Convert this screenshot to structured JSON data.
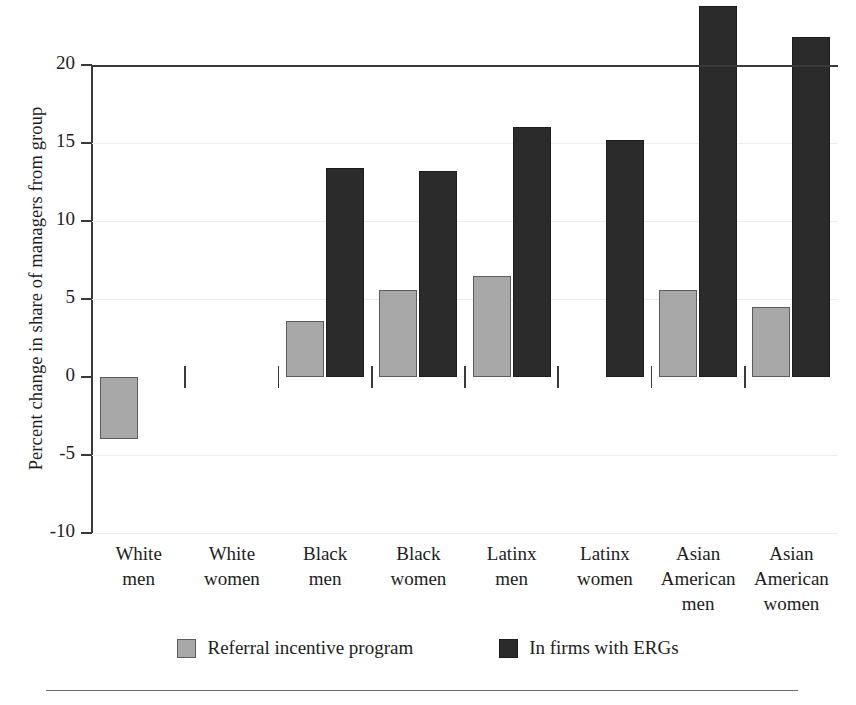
{
  "chart_data": {
    "type": "bar",
    "title": "",
    "subtitle": "",
    "xlabel": "",
    "ylabel": "Percent change in share of managers from group",
    "ylim": [
      -10,
      20
    ],
    "yticks": [
      -10,
      -5,
      0,
      5,
      10,
      15,
      20
    ],
    "ytick_labels": [
      "-10",
      "-5",
      "0",
      "5",
      "10",
      "15",
      "20"
    ],
    "grid": true,
    "grid_axis": "y",
    "legend_position": "bottom-center",
    "categories": [
      "White men",
      "White women",
      "Black men",
      "Black women",
      "Latinx men",
      "Latinx women",
      "Asian American men",
      "Asian American women"
    ],
    "category_lines": [
      [
        "White",
        "men"
      ],
      [
        "White",
        "women"
      ],
      [
        "Black",
        "men"
      ],
      [
        "Black",
        "women"
      ],
      [
        "Latinx",
        "men"
      ],
      [
        "Latinx",
        "women"
      ],
      [
        "Asian",
        "American",
        "men"
      ],
      [
        "Asian",
        "American",
        "women"
      ]
    ],
    "series": [
      {
        "name": "Referral incentive program",
        "color": "#a8a8a8",
        "edge_color": "#5c5c5c",
        "values": [
          -4.0,
          0.0,
          3.6,
          5.6,
          6.5,
          0.0,
          5.6,
          4.5
        ]
      },
      {
        "name": "In firms with ERGs",
        "color": "#2b2b2b",
        "edge_color": "#1c1c1c",
        "values": [
          0.0,
          0.0,
          13.4,
          13.2,
          16.0,
          15.2,
          23.8,
          21.8
        ]
      }
    ]
  },
  "legend": {
    "items": [
      {
        "label": "Referral incentive program",
        "swatch": "series-a"
      },
      {
        "label": "In firms with ERGs",
        "swatch": "series-b"
      }
    ]
  }
}
